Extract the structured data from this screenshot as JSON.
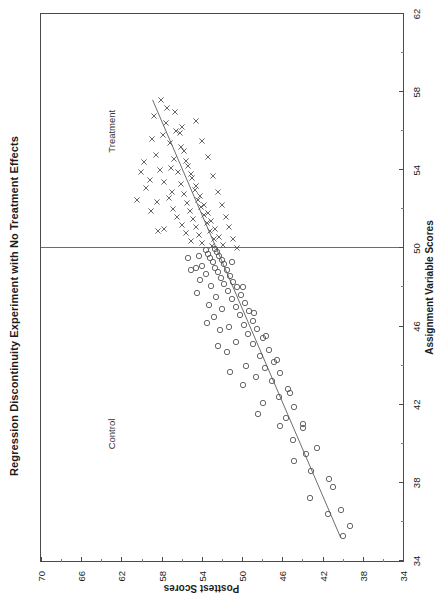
{
  "figure": {
    "title": "Regression Discontinuity Experiment with No Treatment Effects",
    "xlabel": "Assignment Variable Scores",
    "ylabel": "Posttest Scores",
    "group_left_label": "Control",
    "group_right_label": "Treatment",
    "orientation_note": "rotated"
  },
  "chart_data": {
    "type": "scatter",
    "title": "Regression Discontinuity Experiment with No Treatment Effects",
    "xlabel": "Assignment Variable Scores",
    "ylabel": "Posttest Scores",
    "xlim": [
      34,
      62
    ],
    "ylim": [
      34,
      70
    ],
    "xticks": [
      34,
      38,
      42,
      46,
      50,
      54,
      58,
      62
    ],
    "yticks": [
      34,
      38,
      42,
      46,
      50,
      54,
      58,
      62,
      66,
      70
    ],
    "xtick_labels": [
      "34",
      "38",
      "42",
      "46",
      "50",
      "54",
      "58",
      "62"
    ],
    "ytick_labels": [
      "34",
      "38",
      "42",
      "46",
      "50",
      "54",
      "58",
      "62",
      "66",
      "70"
    ],
    "xminor_step": 2,
    "yminor_step": 2,
    "grid": false,
    "legend": "none",
    "cutoff": {
      "value": 50,
      "axis": "x",
      "label_left": "Control",
      "label_right": "Treatment",
      "color": "#6d6d6d"
    },
    "annotations": [
      {
        "text": "Control",
        "x": 40.5,
        "y": 63.5
      },
      {
        "text": "Treatment",
        "x": 56.0,
        "y": 63.5
      }
    ],
    "fit_line": {
      "name": "pooled regression (no discontinuity)",
      "x0": 35.2,
      "y0": 40.2,
      "x1": 57.6,
      "y1": 58.9,
      "slope": 0.835,
      "intercept": 10.8,
      "color": "#6d6d6d"
    },
    "series": [
      {
        "name": "Control",
        "marker": "circle",
        "color": "#555555",
        "points": [
          [
            35.3,
            40.0
          ],
          [
            36.4,
            41.5
          ],
          [
            37.8,
            41.0
          ],
          [
            38.6,
            43.1
          ],
          [
            39.5,
            43.6
          ],
          [
            40.2,
            44.9
          ],
          [
            40.8,
            43.9
          ],
          [
            41.3,
            45.6
          ],
          [
            41.9,
            44.8
          ],
          [
            42.4,
            46.3
          ],
          [
            42.8,
            45.4
          ],
          [
            43.2,
            47.0
          ],
          [
            43.6,
            46.2
          ],
          [
            43.9,
            47.7
          ],
          [
            44.2,
            46.8
          ],
          [
            44.5,
            48.2
          ],
          [
            44.8,
            47.3
          ],
          [
            45.1,
            48.9
          ],
          [
            45.4,
            47.9
          ],
          [
            45.6,
            49.4
          ],
          [
            45.9,
            48.5
          ],
          [
            46.1,
            49.8
          ],
          [
            46.3,
            48.9
          ],
          [
            46.6,
            50.2
          ],
          [
            46.8,
            49.3
          ],
          [
            47.0,
            50.6
          ],
          [
            47.2,
            49.7
          ],
          [
            47.4,
            51.0
          ],
          [
            47.6,
            50.1
          ],
          [
            47.8,
            51.4
          ],
          [
            48.0,
            50.5
          ],
          [
            48.2,
            51.8
          ],
          [
            48.3,
            50.9
          ],
          [
            48.5,
            52.1
          ],
          [
            48.6,
            51.2
          ],
          [
            48.8,
            52.4
          ],
          [
            48.9,
            51.5
          ],
          [
            49.0,
            52.7
          ],
          [
            49.2,
            51.8
          ],
          [
            49.3,
            52.9
          ],
          [
            49.4,
            52.0
          ],
          [
            49.5,
            53.2
          ],
          [
            49.6,
            52.3
          ],
          [
            49.7,
            53.4
          ],
          [
            49.8,
            52.5
          ],
          [
            49.9,
            53.6
          ],
          [
            49.95,
            52.7
          ],
          [
            44.0,
            49.6
          ],
          [
            45.2,
            50.6
          ],
          [
            46.0,
            51.3
          ],
          [
            46.9,
            52.0
          ],
          [
            47.5,
            52.6
          ],
          [
            48.1,
            53.1
          ],
          [
            48.7,
            53.6
          ],
          [
            49.1,
            54.0
          ],
          [
            49.6,
            54.3
          ],
          [
            42.1,
            47.9
          ],
          [
            43.4,
            48.6
          ],
          [
            40.9,
            46.2
          ],
          [
            39.1,
            44.8
          ],
          [
            37.2,
            43.2
          ],
          [
            44.7,
            51.5
          ],
          [
            45.8,
            52.2
          ],
          [
            46.5,
            52.8
          ],
          [
            47.1,
            53.3
          ],
          [
            48.4,
            54.2
          ],
          [
            49.0,
            54.6
          ],
          [
            43.0,
            49.9
          ],
          [
            41.5,
            48.4
          ],
          [
            46.2,
            53.5
          ],
          [
            47.7,
            54.5
          ],
          [
            48.9,
            55.1
          ],
          [
            49.5,
            55.4
          ],
          [
            45.0,
            52.4
          ],
          [
            43.7,
            51.2
          ],
          [
            49.3,
            51.0
          ],
          [
            48.0,
            49.9
          ],
          [
            46.7,
            48.8
          ],
          [
            45.5,
            47.6
          ],
          [
            44.3,
            46.5
          ],
          [
            42.6,
            45.2
          ],
          [
            41.0,
            43.9
          ],
          [
            39.8,
            42.6
          ],
          [
            38.2,
            41.4
          ],
          [
            36.6,
            40.2
          ],
          [
            35.8,
            39.3
          ]
        ]
      },
      {
        "name": "Treatment",
        "marker": "x",
        "color": "#555555",
        "points": [
          [
            50.1,
            53.0
          ],
          [
            50.3,
            54.0
          ],
          [
            50.5,
            52.8
          ],
          [
            50.7,
            54.3
          ],
          [
            50.9,
            53.2
          ],
          [
            51.1,
            54.6
          ],
          [
            51.3,
            53.5
          ],
          [
            51.5,
            54.9
          ],
          [
            51.7,
            53.8
          ],
          [
            51.9,
            55.2
          ],
          [
            52.1,
            54.1
          ],
          [
            52.3,
            55.5
          ],
          [
            52.5,
            54.4
          ],
          [
            52.8,
            55.8
          ],
          [
            53.0,
            54.7
          ],
          [
            53.3,
            56.1
          ],
          [
            53.6,
            55.0
          ],
          [
            53.9,
            56.4
          ],
          [
            54.2,
            55.4
          ],
          [
            54.6,
            56.8
          ],
          [
            55.0,
            55.8
          ],
          [
            55.4,
            57.2
          ],
          [
            55.9,
            56.2
          ],
          [
            56.4,
            57.6
          ],
          [
            57.0,
            56.7
          ],
          [
            57.6,
            58.1
          ],
          [
            50.2,
            51.9
          ],
          [
            50.6,
            52.3
          ],
          [
            51.0,
            52.7
          ],
          [
            51.4,
            53.1
          ],
          [
            51.8,
            53.4
          ],
          [
            52.2,
            53.8
          ],
          [
            52.7,
            54.2
          ],
          [
            53.2,
            54.6
          ],
          [
            53.8,
            55.1
          ],
          [
            54.5,
            55.6
          ],
          [
            55.2,
            56.1
          ],
          [
            56.0,
            56.6
          ],
          [
            50.4,
            55.1
          ],
          [
            50.8,
            55.6
          ],
          [
            51.2,
            56.0
          ],
          [
            51.6,
            56.5
          ],
          [
            52.0,
            56.9
          ],
          [
            52.6,
            57.3
          ],
          [
            53.4,
            57.8
          ],
          [
            54.0,
            58.2
          ],
          [
            54.8,
            58.6
          ],
          [
            55.6,
            59.0
          ],
          [
            51.0,
            57.8
          ],
          [
            52.4,
            58.5
          ],
          [
            53.5,
            59.2
          ],
          [
            52.9,
            57.0
          ],
          [
            54.4,
            59.8
          ],
          [
            55.8,
            57.9
          ],
          [
            56.8,
            58.8
          ],
          [
            50.0,
            50.5
          ],
          [
            50.5,
            50.9
          ],
          [
            51.1,
            51.3
          ],
          [
            51.6,
            51.6
          ],
          [
            52.2,
            52.0
          ],
          [
            52.9,
            52.4
          ],
          [
            53.7,
            52.9
          ],
          [
            54.7,
            53.4
          ],
          [
            55.5,
            54.0
          ],
          [
            56.5,
            54.6
          ],
          [
            52.5,
            60.5
          ],
          [
            53.1,
            59.6
          ],
          [
            54.1,
            57.1
          ],
          [
            56.2,
            56.0
          ],
          [
            57.2,
            57.5
          ],
          [
            51.9,
            59.1
          ],
          [
            50.9,
            58.4
          ],
          [
            53.9,
            60.1
          ]
        ]
      }
    ]
  }
}
